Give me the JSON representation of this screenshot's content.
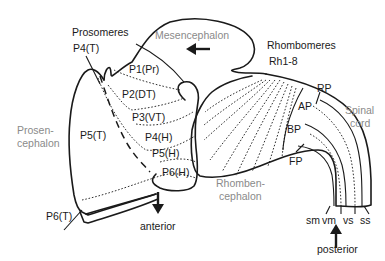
{
  "labels": {
    "prosomeres": "Prosomeres",
    "p4t": "P4(T)",
    "mesencephalon": "Mesencephalon",
    "rhombomeres": "Rhombomeres",
    "rh18": "Rh1-8",
    "p1pr": "P1(Pr)",
    "p2dt": "P2(DT)",
    "p3vt": "P3(VT)",
    "p4h": "P4(H)",
    "p5h": "P5(H)",
    "p6h": "P6(H)",
    "p5t": "P5(T)",
    "p6t": "P6(T)",
    "prosen1": "Prosen-",
    "prosen2": "cephalon",
    "rhomben1": "Rhomben-",
    "rhomben2": "cephalon",
    "rp": "RP",
    "ap": "AP",
    "bp": "BP",
    "fp": "FP",
    "spinal1": "Spinal",
    "spinal2": "cord",
    "sm": "sm",
    "vm": "vm",
    "vs": "vs",
    "ss": "ss",
    "anterior": "anterior",
    "posterior": "posterior"
  },
  "colors": {
    "line": "#1a1a1a",
    "region_label": "#8a8a8a"
  }
}
